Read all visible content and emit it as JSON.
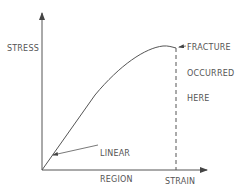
{
  "diagram": {
    "type": "stress-strain curve",
    "axes": {
      "y_label": "STRESS",
      "x_label": "STRAIN"
    },
    "annotations": {
      "fracture": [
        "FRACTURE",
        "OCCURRED",
        "HERE"
      ],
      "linear_region": [
        "LINEAR",
        "REGION"
      ]
    },
    "colors": {
      "line": "#555555",
      "text": "#555555",
      "background": "#ffffff"
    }
  }
}
